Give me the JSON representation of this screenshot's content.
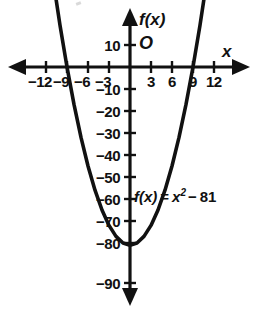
{
  "figure": {
    "kind": "coordinate-plane-graph",
    "line_color": "#111111",
    "background_color": "#ffffff"
  },
  "axes": {
    "x_axis_name": "x",
    "y_axis_name": "f(x)",
    "origin_label": "O"
  },
  "equation": {
    "lhs": "f(x)",
    "equals": "=",
    "variable": "x",
    "exponent": "2",
    "minus": "−",
    "constant": "81",
    "full": "f(x) = x² − 81"
  },
  "chart_data": {
    "type": "line",
    "title": "",
    "subtitle": "",
    "xlabel": "x",
    "ylabel": "f(x)",
    "annotations": [
      "f(x) = x² − 81"
    ],
    "grid": false,
    "legend": "none",
    "xlim": [
      -13.5,
      13.5
    ],
    "ylim": [
      -95,
      14
    ],
    "x_ticks": [
      -12,
      -9,
      -6,
      -3,
      3,
      6,
      9,
      12
    ],
    "x_tick_labels": [
      "−12",
      "−9",
      "−6",
      "−3",
      "3",
      "6",
      "9",
      "12"
    ],
    "y_ticks": [
      10,
      -10,
      -20,
      -30,
      -40,
      -50,
      -60,
      -70,
      -80,
      -90
    ],
    "y_tick_labels": [
      "10",
      "−10",
      "−20",
      "−30",
      "−40",
      "−50",
      "−60",
      "−70",
      "−80",
      "−90"
    ],
    "series": [
      {
        "name": "f(x) = x² − 81",
        "equation": "y = x^2 - 81",
        "vertex": [
          0,
          -81
        ],
        "roots": [
          -9,
          9
        ],
        "x": [
          -12.4,
          -12,
          -11,
          -10,
          -9,
          -8,
          -7,
          -6,
          -5,
          -4,
          -3,
          -2,
          -1,
          0,
          1,
          2,
          3,
          4,
          5,
          6,
          7,
          8,
          9,
          10,
          11,
          12,
          12.4
        ],
        "values": [
          72.8,
          63,
          40,
          19,
          0,
          -17,
          -32,
          -45,
          -56,
          -65,
          -72,
          -77,
          -80,
          -81,
          -80,
          -77,
          -72,
          -65,
          -56,
          -45,
          -32,
          -17,
          0,
          19,
          40,
          63,
          72.8
        ]
      }
    ]
  }
}
